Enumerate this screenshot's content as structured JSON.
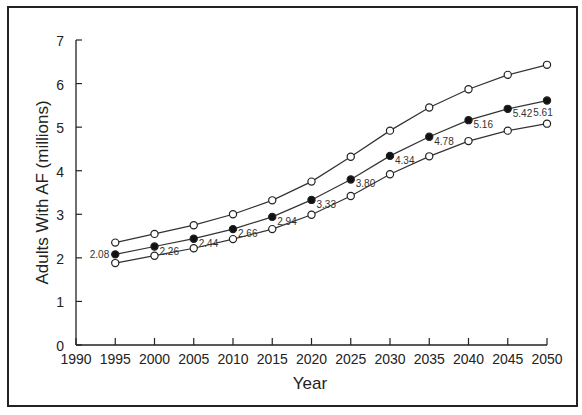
{
  "chart_data": {
    "type": "line",
    "title": "",
    "xlabel": "Year",
    "ylabel": "Adults With AF (millions)",
    "xlim": [
      1990,
      2050
    ],
    "ylim": [
      0,
      7
    ],
    "x_ticks": [
      "1990",
      "1995",
      "2000",
      "2005",
      "2010",
      "2015",
      "2020",
      "2025",
      "2030",
      "2035",
      "2040",
      "2045",
      "2050"
    ],
    "y_ticks": [
      "0",
      "1",
      "2",
      "3",
      "4",
      "5",
      "6",
      "7"
    ],
    "grid": false,
    "legend": null,
    "x": [
      1995,
      2000,
      2005,
      2010,
      2015,
      2020,
      2025,
      2030,
      2035,
      2040,
      2045,
      2050
    ],
    "series": [
      {
        "name": "Upper bound",
        "marker": "open-circle",
        "values": [
          2.35,
          2.55,
          2.75,
          3.0,
          3.32,
          3.75,
          4.32,
          4.92,
          5.45,
          5.87,
          6.2,
          6.43
        ]
      },
      {
        "name": "Estimate",
        "marker": "filled-circle",
        "values": [
          2.08,
          2.26,
          2.44,
          2.66,
          2.94,
          3.33,
          3.8,
          4.34,
          4.78,
          5.16,
          5.42,
          5.61
        ],
        "labels": [
          "2.08",
          "2.26",
          "2.44",
          "2.66",
          "2.94",
          "3.33",
          "3.80",
          "4.34",
          "4.78",
          "5.16",
          "5.42",
          "5.61"
        ]
      },
      {
        "name": "Lower bound",
        "marker": "open-circle",
        "values": [
          1.88,
          2.05,
          2.22,
          2.43,
          2.66,
          2.99,
          3.42,
          3.92,
          4.33,
          4.68,
          4.92,
          5.08
        ]
      }
    ]
  }
}
